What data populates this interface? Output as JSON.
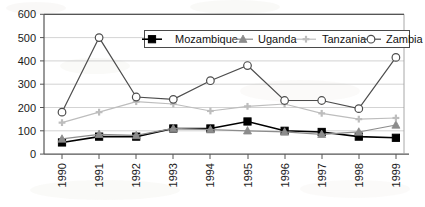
{
  "chart_data": {
    "type": "line",
    "title": "",
    "xlabel": "",
    "ylabel": "",
    "categories": [
      "1990",
      "1991",
      "1992",
      "1993",
      "1994",
      "1995",
      "1996",
      "1997",
      "1998",
      "1999"
    ],
    "ylim": [
      0,
      600
    ],
    "yticks": [
      0,
      100,
      200,
      300,
      400,
      500,
      600
    ],
    "grid": "horizontal",
    "legend_position": "top-right-inside",
    "series": [
      {
        "name": "Mozambique",
        "marker": "filled-square",
        "color": "#000000",
        "values": [
          50,
          75,
          75,
          110,
          110,
          140,
          100,
          95,
          75,
          70
        ]
      },
      {
        "name": "Uganda",
        "marker": "filled-triangle",
        "color": "#8c8c8c",
        "values": [
          65,
          85,
          80,
          110,
          105,
          100,
          95,
          85,
          95,
          125
        ]
      },
      {
        "name": "Tanzania",
        "marker": "small-cross",
        "color": "#bdbdbd",
        "values": [
          135,
          180,
          225,
          215,
          185,
          205,
          215,
          175,
          150,
          155
        ]
      },
      {
        "name": "Zambia",
        "marker": "open-circle",
        "color": "#4d4d4d",
        "values": [
          180,
          500,
          245,
          235,
          315,
          380,
          230,
          230,
          195,
          415
        ]
      }
    ]
  },
  "axis": {
    "y_tick_labels": [
      "600",
      "500",
      "400",
      "300",
      "200",
      "100",
      "0"
    ],
    "x_tick_labels": [
      "1990",
      "1991",
      "1992",
      "1993",
      "1994",
      "1995",
      "1996",
      "1997",
      "1998",
      "1999"
    ]
  },
  "legend": {
    "items": [
      {
        "label": "Mozambique"
      },
      {
        "label": "Uganda"
      },
      {
        "label": "Tanzania"
      },
      {
        "label": "Zambia"
      }
    ]
  },
  "colors": {
    "mozambique": "#000000",
    "uganda": "#8c8c8c",
    "tanzania": "#bdbdbd",
    "zambia": "#4d4d4d",
    "axis": "#555555",
    "grid": "#9a9a9a",
    "background": "#ffffff"
  }
}
